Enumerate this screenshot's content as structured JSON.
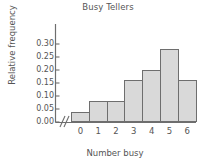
{
  "chart_data": {
    "type": "bar",
    "title": "Busy Tellers",
    "xlabel": "Number busy",
    "ylabel": "Relative frequency",
    "categories": [
      "0",
      "1",
      "2",
      "3",
      "4",
      "5",
      "6"
    ],
    "values": [
      0.04,
      0.08,
      0.08,
      0.16,
      0.2,
      0.28,
      0.16
    ],
    "ylim": [
      0.0,
      0.3
    ],
    "ytick_labels": [
      "0.00",
      "0.05",
      "0.10",
      "0.15",
      "0.20",
      "0.25",
      "0.30"
    ],
    "ytick_values": [
      0.0,
      0.05,
      0.1,
      0.15,
      0.2,
      0.25,
      0.3
    ],
    "grid": false,
    "legend": false,
    "axis_break": "//",
    "bar_fill_color": "#d9d9d9",
    "bar_edge_color": "#6e6e6e",
    "axis_color": "#6e6e6e",
    "text_color": "#555555"
  }
}
